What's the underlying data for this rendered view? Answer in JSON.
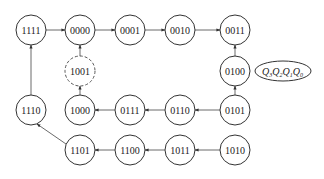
{
  "diagram": {
    "type": "state-transition",
    "legend": {
      "label": "Q3Q2Q1Q0",
      "parts": [
        "Q",
        "3",
        "Q",
        "2",
        "Q",
        "1",
        "Q",
        "0"
      ]
    },
    "states": [
      {
        "id": "s1111",
        "label": "1111",
        "x": 31,
        "y": 30,
        "dashed": false
      },
      {
        "id": "s0000",
        "label": "0000",
        "x": 80,
        "y": 30,
        "dashed": false
      },
      {
        "id": "s0001",
        "label": "0001",
        "x": 130,
        "y": 30,
        "dashed": false
      },
      {
        "id": "s0010",
        "label": "0010",
        "x": 180,
        "y": 30,
        "dashed": false
      },
      {
        "id": "s0011",
        "label": "0011",
        "x": 235,
        "y": 30,
        "dashed": false
      },
      {
        "id": "s1001",
        "label": "1001",
        "x": 80,
        "y": 71,
        "dashed": true
      },
      {
        "id": "s0100",
        "label": "0100",
        "x": 235,
        "y": 71,
        "dashed": false
      },
      {
        "id": "s1110",
        "label": "1110",
        "x": 31,
        "y": 110,
        "dashed": false
      },
      {
        "id": "s1000",
        "label": "1000",
        "x": 80,
        "y": 110,
        "dashed": false
      },
      {
        "id": "s0111",
        "label": "0111",
        "x": 130,
        "y": 110,
        "dashed": false
      },
      {
        "id": "s0110",
        "label": "0110",
        "x": 180,
        "y": 110,
        "dashed": false
      },
      {
        "id": "s0101",
        "label": "0101",
        "x": 235,
        "y": 110,
        "dashed": false
      },
      {
        "id": "s1101",
        "label": "1101",
        "x": 80,
        "y": 150,
        "dashed": false
      },
      {
        "id": "s1100",
        "label": "1100",
        "x": 130,
        "y": 150,
        "dashed": false
      },
      {
        "id": "s1011",
        "label": "1011",
        "x": 180,
        "y": 150,
        "dashed": false
      },
      {
        "id": "s1010",
        "label": "1010",
        "x": 235,
        "y": 150,
        "dashed": false
      }
    ],
    "transitions": [
      {
        "from": "1111",
        "to": "0000"
      },
      {
        "from": "0000",
        "to": "0001"
      },
      {
        "from": "0001",
        "to": "0010"
      },
      {
        "from": "0010",
        "to": "0011"
      },
      {
        "from": "0011",
        "to": "0100"
      },
      {
        "from": "0100",
        "to": "0101"
      },
      {
        "from": "0101",
        "to": "0110"
      },
      {
        "from": "0110",
        "to": "0111"
      },
      {
        "from": "0111",
        "to": "1000"
      },
      {
        "from": "1000",
        "to": "1001"
      },
      {
        "from": "1001",
        "to": "0000"
      },
      {
        "from": "1010",
        "to": "1011"
      },
      {
        "from": "1011",
        "to": "1100"
      },
      {
        "from": "1100",
        "to": "1101"
      },
      {
        "from": "1101",
        "to": "1110"
      },
      {
        "from": "1110",
        "to": "1111"
      }
    ]
  }
}
